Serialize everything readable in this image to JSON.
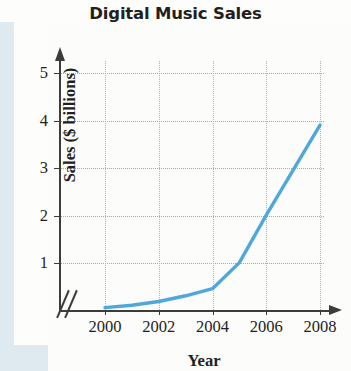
{
  "chart_data": {
    "type": "line",
    "title": "Digital Music Sales",
    "xlabel": "Year",
    "ylabel": "Sales ($ billions)",
    "xlim": [
      2000,
      2008
    ],
    "ylim": [
      0,
      5
    ],
    "grid": true,
    "legend": null,
    "axis_break": true,
    "line_color": "#4fa7dc",
    "x_tick_labels": [
      "2000",
      "2002",
      "2004",
      "2006",
      "2008"
    ],
    "x_ticks": [
      2000,
      2002,
      2004,
      2006,
      2008
    ],
    "y_tick_labels": [
      "1",
      "2",
      "3",
      "4",
      "5"
    ],
    "y_ticks": [
      1,
      2,
      3,
      4,
      5
    ],
    "x": [
      2000,
      2001,
      2002,
      2003,
      2004,
      2005,
      2006,
      2007,
      2008
    ],
    "values": [
      0.05,
      0.1,
      0.18,
      0.3,
      0.45,
      1.0,
      2.0,
      2.95,
      3.9
    ],
    "series": [
      {
        "name": "Digital Music Sales",
        "values": [
          0.05,
          0.1,
          0.18,
          0.3,
          0.45,
          1.0,
          2.0,
          2.95,
          3.9
        ]
      }
    ]
  },
  "figure": {
    "title": "Digital Music Sales",
    "x_axis_title": "Year",
    "y_axis_title": "Sales ($ billions)",
    "axis_break_symbol": "//"
  }
}
